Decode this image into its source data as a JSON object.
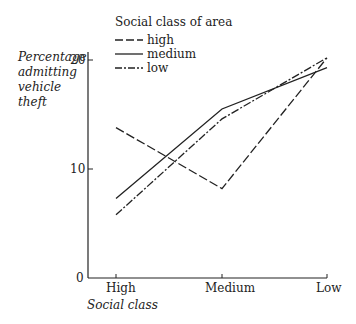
{
  "chart_data": {
    "type": "line",
    "title": "",
    "xlabel": "Social class",
    "ylabel": "Percentage admitting vehicle theft",
    "ylabel_lines": [
      "Percentage",
      "admitting",
      "vehicle",
      "theft"
    ],
    "categories": [
      "High",
      "Medium",
      "Low"
    ],
    "yticks": [
      0,
      10,
      20
    ],
    "ylim": [
      0,
      21
    ],
    "grid": false,
    "legend": {
      "title": "Social class of area",
      "position": "top-left",
      "entries": [
        {
          "label": "high",
          "style": "dashed"
        },
        {
          "label": "medium",
          "style": "solid"
        },
        {
          "label": "low",
          "style": "dash-dot"
        }
      ]
    },
    "series": [
      {
        "name": "high",
        "style": "dashed",
        "values": [
          13.8,
          8.2,
          20.2
        ]
      },
      {
        "name": "medium",
        "style": "solid",
        "values": [
          7.3,
          15.5,
          19.3
        ]
      },
      {
        "name": "low",
        "style": "dash-dot",
        "values": [
          5.8,
          14.6,
          20.2
        ]
      }
    ]
  },
  "colors": {
    "ink": "#222222",
    "background": "#ffffff"
  }
}
